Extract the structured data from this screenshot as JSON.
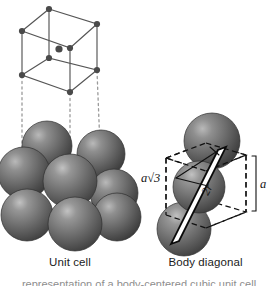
{
  "figure": {
    "title_unit_cell": "Unit cell",
    "title_body_diagonal": "Body diagonal",
    "credit": "© 2013 Cengage Learning",
    "bottom_caption_partial": "representation of a body-centered cubic unit cell"
  },
  "labels": {
    "body_diagonal_length": "a√3",
    "body_diagonal_length_plain": "a√3",
    "two_r": "2r",
    "edge_length": "a"
  },
  "colors": {
    "background": "#ffffff",
    "sphere_base": "#6e6e6e",
    "sphere_shadow": "#3a3a3a",
    "sphere_highlight": "#b4b4b4",
    "sphere_outline": "#2b2b2b",
    "lattice_line": "#555555",
    "lattice_node": "#4a4a4a",
    "dotted_guide": "#9a9a9a",
    "dashed_cube": "#111111",
    "diagonal_bar": "#0a0a0a",
    "text": "#1b1b1b",
    "credit_text": "#4a4a4a"
  },
  "unit_cell_lattice": {
    "description": "body-centered cubic wireframe with 8 corner nodes and 1 center node",
    "node_count": 9,
    "corner_nodes": [
      {
        "id": "front-bottom-left",
        "x": 22,
        "y": 75
      },
      {
        "id": "front-bottom-right",
        "x": 70,
        "y": 92
      },
      {
        "id": "front-top-left",
        "x": 22,
        "y": 31
      },
      {
        "id": "front-top-right",
        "x": 70,
        "y": 48
      },
      {
        "id": "back-bottom-left",
        "x": 49,
        "y": 58
      },
      {
        "id": "back-bottom-right",
        "x": 97,
        "y": 70
      },
      {
        "id": "back-top-left",
        "x": 49,
        "y": 9
      },
      {
        "id": "back-top-right",
        "x": 97,
        "y": 24
      }
    ],
    "center_node": {
      "id": "body-center",
      "x": 60,
      "y": 50
    },
    "guide_lines": [
      {
        "from_x": 22,
        "from_y": 75,
        "to_x": 22,
        "to_y": 160
      },
      {
        "from_x": 70,
        "from_y": 92,
        "to_x": 70,
        "to_y": 174
      },
      {
        "from_x": 97,
        "from_y": 70,
        "to_x": 97,
        "to_y": 148
      }
    ]
  },
  "unit_cell_spheres": [
    {
      "id": "back-top-left",
      "cx": 47,
      "cy": 145,
      "r": 25
    },
    {
      "id": "back-top-right",
      "cx": 101,
      "cy": 153,
      "r": 24
    },
    {
      "id": "mid-left",
      "cx": 25,
      "cy": 172,
      "r": 26
    },
    {
      "id": "center",
      "cx": 70,
      "cy": 180,
      "r": 27
    },
    {
      "id": "mid-right",
      "cx": 113,
      "cy": 192,
      "r": 24
    },
    {
      "id": "front-left",
      "cx": 28,
      "cy": 214,
      "r": 26
    },
    {
      "id": "front-center",
      "cx": 74,
      "cy": 223,
      "r": 27
    },
    {
      "id": "front-right",
      "cx": 116,
      "cy": 216,
      "r": 24
    }
  ],
  "body_diagonal_spheres": [
    {
      "id": "top",
      "cx": 211,
      "cy": 140,
      "r": 28
    },
    {
      "id": "middle",
      "cx": 198,
      "cy": 186,
      "r": 26
    },
    {
      "id": "bottom",
      "cx": 185,
      "cy": 228,
      "r": 27
    }
  ],
  "body_diagonal_cube": {
    "description": "dashed cube outline enclosing three touching spheres along the body diagonal",
    "diagonal_start": {
      "x": 175,
      "y": 243
    },
    "diagonal_end": {
      "x": 222,
      "y": 148
    }
  }
}
